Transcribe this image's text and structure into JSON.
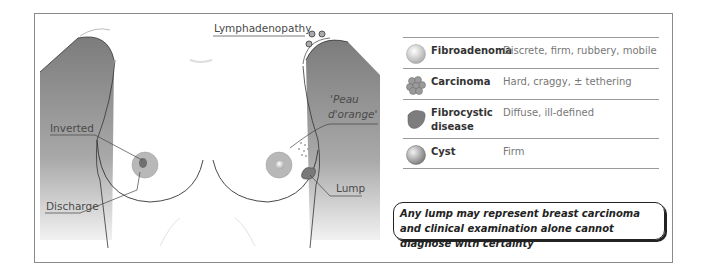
{
  "illustration": {
    "labels": {
      "lymphadenopathy": "Lymphadenopathy",
      "peau_dorange_line1": "'Peau",
      "peau_dorange_line2": "d'orange'",
      "inverted": "Inverted",
      "discharge": "Discharge",
      "lump": "Lump"
    }
  },
  "legend": {
    "rows": [
      {
        "icon": "smooth-sphere-icon",
        "name": "Fibroadenoma",
        "description": "Discrete, firm, rubbery, mobile"
      },
      {
        "icon": "cluster-icon",
        "name": "Carcinoma",
        "description": "Hard, craggy, ± tethering"
      },
      {
        "icon": "irregular-mass-icon",
        "name": "Fibrocystic disease",
        "description": "Diffuse, ill-defined"
      },
      {
        "icon": "shaded-sphere-icon",
        "name": "Cyst",
        "description": "Firm"
      }
    ]
  },
  "note": {
    "text": "Any lump may represent breast carcinoma and clinical examination alone cannot diagnose with certainty"
  },
  "colors": {
    "arm_shade": "#8c8c8c",
    "areola": "#b8b8b8",
    "outline": "#333333"
  }
}
